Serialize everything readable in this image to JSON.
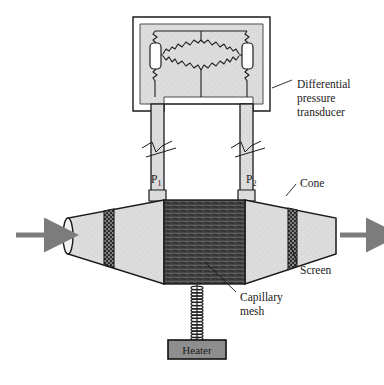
{
  "figure": {
    "type": "technical-diagram",
    "background": "#ffffff"
  },
  "labels": {
    "transducer": "Differential\npressure\ntransducer",
    "transducer_lines": [
      "Differential",
      "pressure",
      "transducer"
    ],
    "cone": "Cone",
    "screen": "Screen",
    "capillary_lines": [
      "Capillary",
      "mesh"
    ],
    "heater": "Heater",
    "p1_base": "P",
    "p1_sub": "1",
    "p2_base": "P",
    "p2_sub": "2"
  },
  "colors": {
    "outline": "#1a1a1a",
    "body_fill": "#d8d8d8",
    "cone_fill": "#dcdcdc",
    "mesh_dark": "#2b2b2b",
    "mesh_stripe": "#6e6e6e",
    "screen_dark": "#242424",
    "arrow_gray": "#7c7c7c",
    "heater_fill": "#8e8e8e",
    "capsule_fill": "#fdfdfd",
    "text": "#1a1a1a"
  },
  "components": {
    "transducer_box": {
      "x": 133,
      "y": 17,
      "width": 137,
      "height": 94
    },
    "bridge": {
      "resistors": 4,
      "shape": "diamond",
      "capsules": 2
    },
    "left_tube": {
      "x": 151,
      "y": 111,
      "width": 13,
      "height": 90
    },
    "right_tube": {
      "x": 240,
      "y": 111,
      "width": 13,
      "height": 90
    },
    "break_marks": 2,
    "mesh_block": {
      "x": 164,
      "y": 200,
      "width": 81,
      "height": 84
    },
    "left_cone": {
      "x": 63,
      "y": 200,
      "width": 101
    },
    "right_cone": {
      "x": 245,
      "y": 200,
      "width": 91
    },
    "screens": 2,
    "heater_box": {
      "x": 168,
      "y": 340,
      "width": 58,
      "height": 18
    },
    "coil_turns": 17,
    "flow_arrows": 2
  }
}
